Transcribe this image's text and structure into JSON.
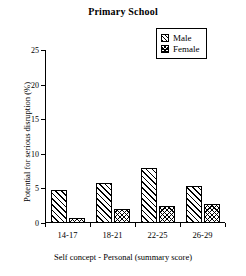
{
  "chart_data": {
    "type": "bar",
    "title": "Primary School",
    "xlabel": "Self concept - Personal (summary score)",
    "ylabel": "Potential for serious disruption (%)",
    "categories": [
      "14-17",
      "18-21",
      "22-25",
      "26-29"
    ],
    "series": [
      {
        "name": "Male",
        "values": [
          4.8,
          5.8,
          8.0,
          5.4
        ]
      },
      {
        "name": "Female",
        "values": [
          0.7,
          2.0,
          2.4,
          2.8
        ]
      }
    ],
    "ylim": [
      0,
      25
    ],
    "yticks": [
      0,
      5,
      10,
      15,
      20,
      25
    ],
    "ytick_labels": [
      "0",
      "5",
      "10",
      "15",
      "20",
      "25"
    ],
    "grid": false,
    "legend_position": "top-right",
    "legend_entries": [
      "Male",
      "Female"
    ]
  },
  "legend": {
    "male_label": "Male",
    "female_label": "Female",
    "male_swatch": "hatch-diagonal-icon",
    "female_swatch": "hatch-crosshatch-icon"
  }
}
